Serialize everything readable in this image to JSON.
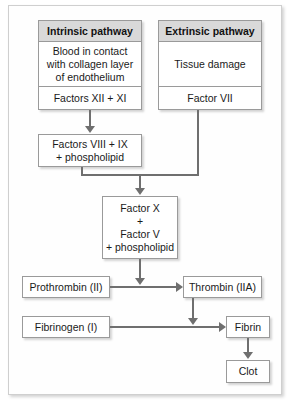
{
  "diagram": {
    "colors": {
      "arrow": "#6f6f6f",
      "box_border": "#9a9a9a",
      "header_fill": "#d9d9d9",
      "box_fill": "#ffffff",
      "page_fill": "#ffffff",
      "text": "#1a1a1a"
    },
    "intrinsic": {
      "header": "Intrinsic pathway",
      "body": "Blood in contact with collagen layer of endothelium",
      "footer": "Factors XII + XI"
    },
    "extrinsic": {
      "header": "Extrinsic pathway",
      "body": "Tissue damage",
      "footer": "Factor VII"
    },
    "nodes": {
      "factors_8_9": "Factors VIII + IX\n+ phospholipid",
      "factors_8_9_line1": "Factors VIII + IX",
      "factors_8_9_line2": "+ phospholipid",
      "factor_x_line1": "Factor X",
      "factor_x_line2": "+",
      "factor_x_line3": "Factor V",
      "factor_x_line4": "+ phospholipid",
      "prothrombin": "Prothrombin (II)",
      "thrombin": "Thrombin (IIA)",
      "fibrinogen": "Fibrinogen (I)",
      "fibrin": "Fibrin",
      "clot": "Clot"
    },
    "edges": [
      {
        "from": "Factors XII + XI",
        "to": "Factors VIII + IX + phospholipid",
        "type": "arrow-down"
      },
      {
        "from": "Factor VII",
        "to": "junction",
        "type": "line-down"
      },
      {
        "from": "Factors VIII + IX + phospholipid",
        "to": "junction",
        "type": "line-down"
      },
      {
        "from": "junction",
        "to": "Factor X + Factor V + phospholipid",
        "type": "arrow-down"
      },
      {
        "from": "Factor X + Factor V + phospholipid",
        "to": "Prothrombin to Thrombin arrow",
        "type": "arrow-down"
      },
      {
        "from": "Prothrombin (II)",
        "to": "Thrombin (IIA)",
        "type": "arrow-right"
      },
      {
        "from": "Thrombin (IIA)",
        "to": "Fibrinogen to Fibrin arrow",
        "type": "arrow-down"
      },
      {
        "from": "Fibrinogen (I)",
        "to": "Fibrin",
        "type": "arrow-right"
      },
      {
        "from": "Fibrin",
        "to": "Clot",
        "type": "arrow-down"
      }
    ]
  }
}
